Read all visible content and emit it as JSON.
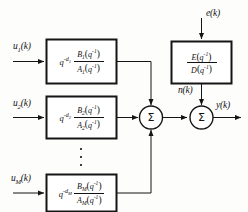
{
  "diagram": {
    "line_color": "#151515",
    "box_fill": "#ffffff",
    "text_color": "#121212"
  },
  "inputs": [
    {
      "id": "u1",
      "label": "u",
      "sub": "1",
      "suffix": "(k)"
    },
    {
      "id": "u2",
      "label": "u",
      "sub": "2",
      "suffix": "(k)"
    },
    {
      "id": "uM",
      "label": "u",
      "sub": "M",
      "suffix": "(k)"
    }
  ],
  "blocks": [
    {
      "id": "block-1",
      "delay_base": "q",
      "delay_exp": "-d",
      "delay_exp_sub": "1",
      "numerator": "B",
      "numerator_sub": "1",
      "denominator": "A",
      "denominator_sub": "1",
      "arg": "q",
      "arg_exp": "-1"
    },
    {
      "id": "block-2",
      "delay_base": "q",
      "delay_exp": "-d",
      "delay_exp_sub": "2",
      "numerator": "B",
      "numerator_sub": "2",
      "denominator": "A",
      "denominator_sub": "2",
      "arg": "q",
      "arg_exp": "-1"
    },
    {
      "id": "block-M",
      "delay_base": "q",
      "delay_exp": "-d",
      "delay_exp_sub": "M",
      "numerator": "B",
      "numerator_sub": "M",
      "denominator": "A",
      "denominator_sub": "M",
      "arg": "q",
      "arg_exp": "-1"
    }
  ],
  "noise": {
    "source_label": "e",
    "source_suffix": "(k)",
    "block_id": "noise-block",
    "numerator": "E",
    "denominator": "D",
    "arg": "q",
    "arg_exp": "-1",
    "output_label": "n",
    "output_suffix": "(k)"
  },
  "summers": [
    {
      "id": "sum-inputs",
      "glyph": "Σ"
    },
    {
      "id": "sum-output",
      "glyph": "Σ"
    }
  ],
  "output": {
    "label": "y",
    "suffix": "(k)"
  },
  "ellipsis": {
    "dot_count": 3,
    "meaning": "additional input channels between 2 and M"
  }
}
